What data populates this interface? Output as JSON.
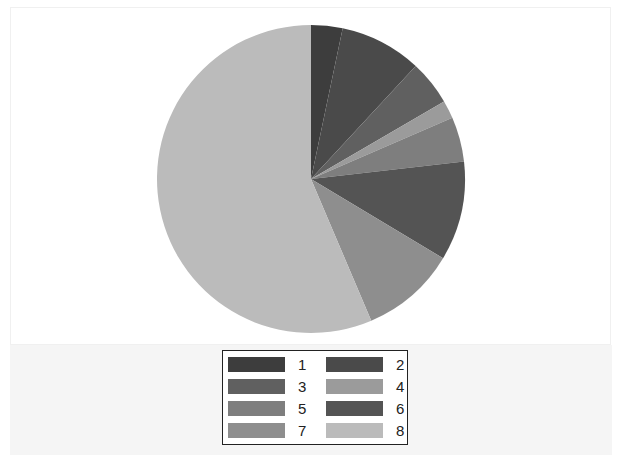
{
  "chart_data": {
    "type": "pie",
    "title": "",
    "start_angle": "12 o'clock",
    "direction": "clockwise",
    "categories": [
      "1",
      "2",
      "3",
      "4",
      "5",
      "6",
      "7",
      "8"
    ],
    "values": [
      3.3,
      8.6,
      4.7,
      1.9,
      4.7,
      10.4,
      10.0,
      56.4
    ],
    "unit": "percent (estimated)",
    "colors": [
      "#3d3d3d",
      "#4a4a4a",
      "#606060",
      "#9b9b9b",
      "#7e7e7e",
      "#545454",
      "#8e8e8e",
      "#bbbbbb"
    ],
    "legend": {
      "position": "bottom-center",
      "columns": 2,
      "entries": [
        "1",
        "2",
        "3",
        "4",
        "5",
        "6",
        "7",
        "8"
      ]
    }
  },
  "layout": {
    "center": [
      311,
      179
    ],
    "radius": 154
  }
}
